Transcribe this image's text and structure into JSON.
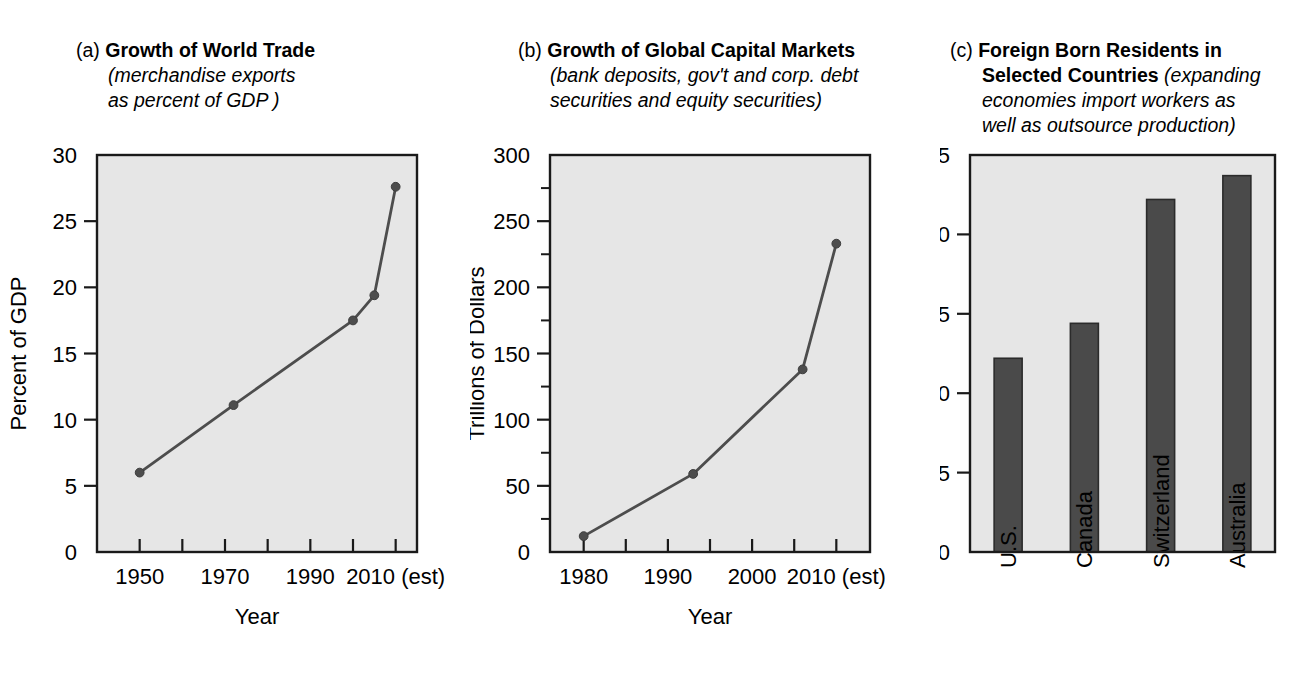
{
  "figure": {
    "background_color": "#ffffff",
    "plot_area_color": "#e6e6e6",
    "ink_color": "#1a1a1a",
    "series_color": "#4d4d4d",
    "bar_color": "#4a4a4a"
  },
  "panels": {
    "a": {
      "tag": "(a)",
      "title": "Growth of World Trade",
      "subtitle_line1": "(merchandise exports",
      "subtitle_line2": "as percent of GDP )"
    },
    "b": {
      "tag": "(b)",
      "title": "Growth of Global Capital Markets",
      "subtitle_line1": "(bank deposits, gov't and corp. debt",
      "subtitle_line2": "securities and equity securities)"
    },
    "c": {
      "tag": "(c)",
      "title_line1": "Foreign Born Residents in",
      "title_line2": "Selected Countries",
      "subtitle_line1": "(expanding",
      "subtitle_line2": "economies import workers as",
      "subtitle_line3": "well as outsource production)"
    }
  },
  "chart_data": [
    {
      "id": "a",
      "type": "line",
      "title": "Growth of World Trade (merchandise exports as percent of GDP)",
      "xlabel": "Year",
      "ylabel": "Percent of GDP",
      "x": [
        1950,
        1972,
        2000,
        2005,
        2010
      ],
      "values": [
        6.0,
        11.1,
        17.5,
        19.4,
        27.6
      ],
      "xlim": [
        1940,
        2015
      ],
      "ylim": [
        0,
        30
      ],
      "xticks": [
        1950,
        1960,
        1970,
        1980,
        1990,
        2000,
        2010
      ],
      "xticklabels": [
        "1950",
        "",
        "1970",
        "",
        "1990",
        "",
        "2010 (est)"
      ],
      "yticks": [
        0,
        5,
        10,
        15,
        20,
        25,
        30
      ],
      "yticklabels": [
        "0",
        "5",
        "10",
        "15",
        "20",
        "25",
        "30"
      ],
      "minor_yticks": [],
      "grid": false,
      "legend": "none"
    },
    {
      "id": "b",
      "type": "line",
      "title": "Growth of Global Capital Markets (bank deposits, gov't and corp. debt securities and equity securities)",
      "xlabel": "Year",
      "ylabel": "Trillions of Dollars",
      "x": [
        1980,
        1993,
        2006,
        2010
      ],
      "values": [
        12,
        59,
        138,
        233
      ],
      "xlim": [
        1976,
        2014
      ],
      "ylim": [
        0,
        300
      ],
      "xticks": [
        1980,
        1985,
        1990,
        1995,
        2000,
        2005,
        2010
      ],
      "xticklabels": [
        "1980",
        "",
        "1990",
        "",
        "2000",
        "",
        "2010 (est)"
      ],
      "yticks": [
        0,
        50,
        100,
        150,
        200,
        250,
        300
      ],
      "yticklabels": [
        "0",
        "50",
        "100",
        "150",
        "200",
        "250",
        "300"
      ],
      "minor_yticks": [
        25,
        75,
        125,
        175,
        225,
        275
      ],
      "grid": false,
      "legend": "none"
    },
    {
      "id": "c",
      "type": "bar",
      "title": "Foreign Born Residents in Selected Countries (expanding economies import workers as well as outsource production)",
      "xlabel": "",
      "ylabel": "Percent",
      "categories": [
        "U.S.",
        "Canada",
        "Switzerland",
        "Australia"
      ],
      "values": [
        12.2,
        14.4,
        22.2,
        23.7
      ],
      "ylim": [
        0,
        25
      ],
      "yticks": [
        0,
        5,
        10,
        15,
        20,
        25
      ],
      "yticklabels": [
        "0",
        "5",
        "10",
        "15",
        "20",
        "25"
      ],
      "grid": false,
      "legend": "none"
    }
  ]
}
